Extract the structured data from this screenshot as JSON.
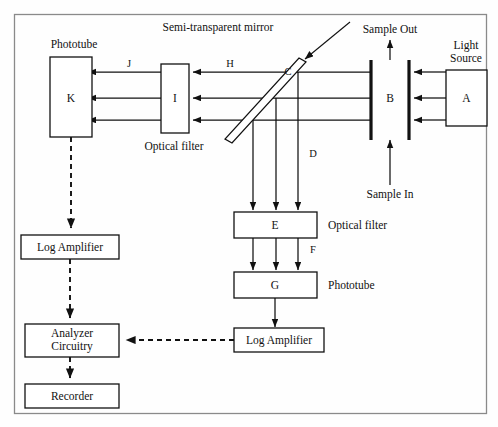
{
  "figure": {
    "border_color": "#8a8a8a",
    "line_color": "#111111",
    "background": "#fefefe"
  },
  "annotations": {
    "semi_transparent_mirror": "Semi-transparent mirror",
    "sample_out": "Sample Out",
    "sample_in": "Sample In",
    "light_source": "Light\nSource",
    "light_source_line1": "Light",
    "light_source_line2": "Source",
    "phototube_top_left": "Phototube",
    "optical_filter_left": "Optical filter",
    "optical_filter_right": "Optical filter",
    "phototube_right": "Phototube"
  },
  "beam_labels": {
    "J": "J",
    "H": "H",
    "C": "C",
    "D": "D",
    "F": "F"
  },
  "components": [
    {
      "id": "A",
      "label": "A",
      "name": "light-source-box",
      "caption": "Light Source"
    },
    {
      "id": "B",
      "label": "B",
      "name": "sample-cell",
      "caption": ""
    },
    {
      "id": "C",
      "label": "C",
      "name": "semi-transparent-mirror",
      "caption": "Semi-transparent mirror"
    },
    {
      "id": "E",
      "label": "E",
      "name": "optical-filter-lower",
      "caption": "Optical filter"
    },
    {
      "id": "G",
      "label": "G",
      "name": "phototube-lower",
      "caption": "Phototube"
    },
    {
      "id": "I",
      "label": "I",
      "name": "optical-filter-left",
      "caption": "Optical filter"
    },
    {
      "id": "K",
      "label": "K",
      "name": "phototube-left",
      "caption": "Phototube"
    }
  ],
  "blocks": {
    "log_amplifier_left": "Log Amplifier",
    "log_amplifier_right": "Log Amplifier",
    "analyzer_line1": "Analyzer",
    "analyzer_line2": "Circuitry",
    "recorder": "Recorder"
  }
}
